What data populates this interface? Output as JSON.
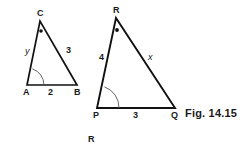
{
  "figure": {
    "caption": "Fig. 14.15",
    "stray_label": "R",
    "stroke_color": "#111111",
    "background_color": "#ffffff",
    "triangles": [
      {
        "name": "triangle-abc",
        "vertices": [
          {
            "label": "A",
            "x": 27,
            "y": 85,
            "label_x": 23,
            "label_y": 88
          },
          {
            "label": "B",
            "x": 77,
            "y": 85,
            "label_x": 74,
            "label_y": 88
          },
          {
            "label": "C",
            "x": 40,
            "y": 21,
            "label_x": 37,
            "label_y": 9
          }
        ],
        "sides": [
          {
            "label": "y",
            "italic": true,
            "x": 25,
            "y": 47
          },
          {
            "label": "3",
            "italic": false,
            "x": 66,
            "y": 46
          },
          {
            "label": "2",
            "italic": false,
            "x": 48,
            "y": 88
          }
        ],
        "angle_marks": [
          {
            "type": "arc",
            "at": "A",
            "radius": 17
          },
          {
            "type": "dot",
            "at": "C",
            "x": 41,
            "y": 31
          }
        ]
      },
      {
        "name": "triangle-pqr",
        "vertices": [
          {
            "label": "P",
            "x": 97,
            "y": 108,
            "label_x": 93,
            "label_y": 111
          },
          {
            "label": "Q",
            "x": 175,
            "y": 108,
            "label_x": 171,
            "label_y": 111
          },
          {
            "label": "R",
            "x": 116,
            "y": 18,
            "label_x": 113,
            "label_y": 6
          }
        ],
        "sides": [
          {
            "label": "4",
            "italic": false,
            "x": 99,
            "y": 53
          },
          {
            "label": "x",
            "italic": true,
            "x": 148,
            "y": 53
          },
          {
            "label": "3",
            "italic": false,
            "x": 133,
            "y": 111
          }
        ],
        "angle_marks": [
          {
            "type": "arc",
            "at": "P",
            "radius": 22
          },
          {
            "type": "dot",
            "at": "R",
            "x": 117,
            "y": 30
          }
        ]
      }
    ]
  }
}
